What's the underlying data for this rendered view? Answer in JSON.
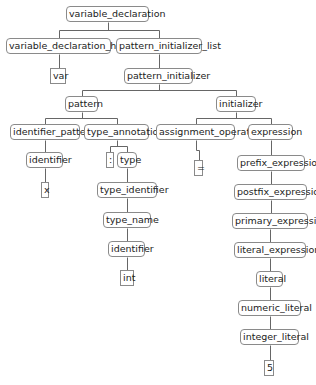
{
  "diagram": {
    "type": "parse-tree",
    "nodes": [
      {
        "id": "n0",
        "label": "variable_declaration",
        "x": 66,
        "y": 6,
        "w": 83,
        "leaf": false
      },
      {
        "id": "n1",
        "label": "variable_declaration_head",
        "x": 6,
        "y": 38,
        "w": 105,
        "leaf": false
      },
      {
        "id": "n2",
        "label": "pattern_initializer_list",
        "x": 116,
        "y": 38,
        "w": 86,
        "leaf": false
      },
      {
        "id": "n3",
        "label": "var",
        "x": 50,
        "y": 68,
        "w": 16,
        "leaf": true
      },
      {
        "id": "n4",
        "label": "pattern_initializer",
        "x": 124,
        "y": 68,
        "w": 69,
        "leaf": false
      },
      {
        "id": "n5",
        "label": "pattern",
        "x": 65,
        "y": 96,
        "w": 33,
        "leaf": false
      },
      {
        "id": "n6",
        "label": "initializer",
        "x": 216,
        "y": 96,
        "w": 40,
        "leaf": false
      },
      {
        "id": "n7",
        "label": "identifier_pattern",
        "x": 10,
        "y": 124,
        "w": 70,
        "leaf": false
      },
      {
        "id": "n8",
        "label": "type_annotation",
        "x": 84,
        "y": 124,
        "w": 65,
        "leaf": false
      },
      {
        "id": "n9",
        "label": "assignment_operator",
        "x": 156,
        "y": 124,
        "w": 79,
        "leaf": false
      },
      {
        "id": "n10",
        "label": "expression",
        "x": 248,
        "y": 124,
        "w": 45,
        "leaf": false
      },
      {
        "id": "n11",
        "label": "identifier",
        "x": 26,
        "y": 152,
        "w": 37,
        "leaf": false
      },
      {
        "id": "n12",
        "label": ":",
        "x": 106,
        "y": 152,
        "w": 8,
        "leaf": true
      },
      {
        "id": "n13",
        "label": "type",
        "x": 117,
        "y": 152,
        "w": 20,
        "leaf": false
      },
      {
        "id": "n14",
        "label": "=",
        "x": 194,
        "y": 160,
        "w": 9,
        "leaf": true
      },
      {
        "id": "n15",
        "label": "prefix_expression",
        "x": 237,
        "y": 155,
        "w": 68,
        "leaf": false
      },
      {
        "id": "n16",
        "label": "x",
        "x": 41,
        "y": 182,
        "w": 8,
        "leaf": true
      },
      {
        "id": "n17",
        "label": "type_identifier",
        "x": 97,
        "y": 182,
        "w": 60,
        "leaf": false
      },
      {
        "id": "n18",
        "label": "postfix_expression",
        "x": 234,
        "y": 184,
        "w": 73,
        "leaf": false
      },
      {
        "id": "n19",
        "label": "type_name",
        "x": 103,
        "y": 212,
        "w": 48,
        "leaf": false
      },
      {
        "id": "n20",
        "label": "primary_expression",
        "x": 232,
        "y": 213,
        "w": 76,
        "leaf": false
      },
      {
        "id": "n21",
        "label": "identifier",
        "x": 108,
        "y": 241,
        "w": 37,
        "leaf": false
      },
      {
        "id": "n22",
        "label": "literal_expression",
        "x": 234,
        "y": 242,
        "w": 72,
        "leaf": false
      },
      {
        "id": "n23",
        "label": "int",
        "x": 120,
        "y": 270,
        "w": 14,
        "leaf": true
      },
      {
        "id": "n24",
        "label": "literal",
        "x": 256,
        "y": 271,
        "w": 27,
        "leaf": false
      },
      {
        "id": "n25",
        "label": "numeric_literal",
        "x": 238,
        "y": 300,
        "w": 63,
        "leaf": false
      },
      {
        "id": "n26",
        "label": "integer_literal",
        "x": 240,
        "y": 329,
        "w": 59,
        "leaf": false
      },
      {
        "id": "n27",
        "label": "5",
        "x": 264,
        "y": 360,
        "w": 10,
        "leaf": true
      }
    ],
    "edges": [
      [
        "n0",
        "n1"
      ],
      [
        "n0",
        "n2"
      ],
      [
        "n1",
        "n3"
      ],
      [
        "n2",
        "n4"
      ],
      [
        "n4",
        "n5"
      ],
      [
        "n4",
        "n6"
      ],
      [
        "n5",
        "n7"
      ],
      [
        "n5",
        "n8"
      ],
      [
        "n6",
        "n9"
      ],
      [
        "n6",
        "n10"
      ],
      [
        "n7",
        "n11"
      ],
      [
        "n8",
        "n12"
      ],
      [
        "n8",
        "n13"
      ],
      [
        "n9",
        "n14"
      ],
      [
        "n10",
        "n15"
      ],
      [
        "n11",
        "n16"
      ],
      [
        "n13",
        "n17"
      ],
      [
        "n15",
        "n18"
      ],
      [
        "n17",
        "n19"
      ],
      [
        "n18",
        "n20"
      ],
      [
        "n19",
        "n21"
      ],
      [
        "n20",
        "n22"
      ],
      [
        "n21",
        "n23"
      ],
      [
        "n22",
        "n24"
      ],
      [
        "n24",
        "n25"
      ],
      [
        "n25",
        "n26"
      ],
      [
        "n26",
        "n27"
      ]
    ]
  }
}
